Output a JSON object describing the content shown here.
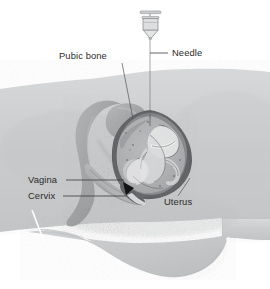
{
  "figure": {
    "canvas": {
      "width": 270,
      "height": 289
    },
    "background_color": "#ffffff"
  },
  "labels": [
    {
      "key": "pubic_bone",
      "text": "Pubic bone",
      "x": 59,
      "y": 59,
      "leader_from": [
        122,
        63
      ],
      "leader_to": [
        133,
        119
      ]
    },
    {
      "key": "needle",
      "text": "Needle",
      "x": 172,
      "y": 56,
      "leader_from": [
        168,
        53
      ],
      "leader_to": [
        150,
        53
      ]
    },
    {
      "key": "vagina",
      "text": "Vagina",
      "x": 28,
      "y": 183,
      "leader_from": [
        66,
        180
      ],
      "leader_to": [
        124,
        180
      ]
    },
    {
      "key": "cervix",
      "text": "Cervix",
      "x": 28,
      "y": 199,
      "leader_from": [
        63,
        196
      ],
      "leader_to": [
        127,
        196
      ]
    },
    {
      "key": "uterus",
      "text": "Uterus",
      "x": 164,
      "y": 205,
      "leader_from": [
        178,
        196
      ],
      "leader_to": [
        190,
        178
      ]
    }
  ],
  "anatomy": {
    "body_fill": "#c9cbcc",
    "body_fill_light": "#d4d6d7",
    "bone_fill": "#a9abad",
    "bone_stroke": "#8e9092",
    "uterus_wall": "#6b6d6f",
    "uterus_interior": "#b9bbbd",
    "fetus_light": "#e2e3e4",
    "needle_color": "#8c8e90",
    "syringe_color": "#a8aaac",
    "cervix_marker": "#1b1b1b",
    "scratch_color": "#fdfdfd"
  },
  "colors": {
    "text": "#2b2b2b",
    "leader": "#3a3a3a"
  },
  "parts": [
    {
      "key": "syringe",
      "name": "syringe-barrel"
    },
    {
      "key": "needle_shaft",
      "name": "needle-shaft"
    },
    {
      "key": "skin_surface",
      "name": "abdominal-skin-surface"
    },
    {
      "key": "pubic_bone_shape",
      "name": "pubic-bone"
    },
    {
      "key": "uterus_shape",
      "name": "uterus-outline"
    },
    {
      "key": "fetus_shape",
      "name": "fetus"
    },
    {
      "key": "vagina_shape",
      "name": "vaginal-canal"
    },
    {
      "key": "cervix_shape",
      "name": "cervix"
    },
    {
      "key": "belly_bulge",
      "name": "lower-abdomen-bulge"
    }
  ]
}
